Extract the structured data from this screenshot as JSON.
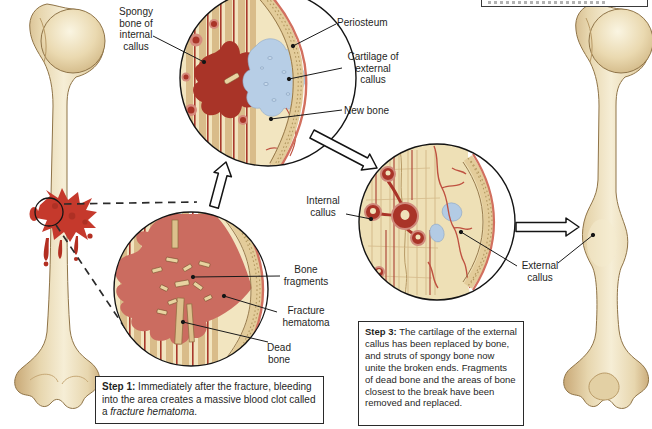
{
  "figure": {
    "type": "anatomy-diagram",
    "labels": {
      "spongy_bone": "Spongy\nbone of\ninternal\ncallus",
      "periosteum": "Periosteum",
      "cartilage": "Cartilage of\nexternal\ncallus",
      "new_bone": "New bone",
      "bone_fragments": "Bone\nfragments",
      "fracture_hematoma": "Fracture\nhematoma",
      "dead_bone": "Dead\nbone",
      "internal_callus": "Internal\ncallus",
      "external_callus": "External\ncallus"
    },
    "steps": {
      "step1": {
        "title": "Step 1:",
        "before_italic": " Immediately after the fracture, bleeding into the area creates a massive blood clot called a ",
        "italic": "fracture hematoma",
        "after_italic": "."
      },
      "step3": {
        "title": "Step 3:",
        "body": " The cartilage of the external callus has been replaced by bone, and struts of spongy bone now unite the broken ends. Fragments of dead bone and the areas of bone closest to the break have been removed and replaced."
      }
    },
    "colors": {
      "background": "#ffffff",
      "bone_fill": "#e9d9b2",
      "bone_shade": "#c9a977",
      "bone_outline": "#8f7448",
      "blood_red": "#c5392c",
      "hematoma_red": "#cb6c60",
      "callus_dark_red": "#a93428",
      "cartilage_blue": "#b7cee6",
      "marrow_cream": "#f2e5c0",
      "stripe_tan": "#d9bc8a",
      "vessel_red": "#bf5140",
      "label_text": "#1f1f1e"
    }
  }
}
